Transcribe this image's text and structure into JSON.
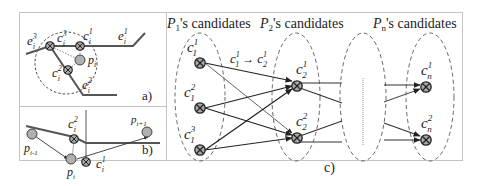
{
  "figure": {
    "panel_a": {
      "label": "a)",
      "edges": [
        {
          "name": "e",
          "sup": "3",
          "sub": "i"
        },
        {
          "name": "e",
          "sup": "1",
          "sub": "i"
        },
        {
          "name": "e",
          "sup": "2",
          "sub": "i"
        }
      ],
      "candidates": [
        {
          "name": "c",
          "sup": "3",
          "sub": "i"
        },
        {
          "name": "c",
          "sup": "1",
          "sub": "i"
        },
        {
          "name": "c",
          "sup": "2",
          "sub": "i"
        }
      ],
      "point": {
        "name": "p",
        "sub": "i"
      }
    },
    "panel_b": {
      "label": "b)",
      "points": [
        {
          "name": "p",
          "sub": "i-1"
        },
        {
          "name": "p",
          "sub": "i"
        },
        {
          "name": "p",
          "sub": "i+1"
        }
      ],
      "candidates": [
        {
          "name": "c",
          "sup": "2",
          "sub": "i"
        },
        {
          "name": "c",
          "sup": "1",
          "sub": "i"
        }
      ]
    },
    "panel_c": {
      "label": "c)",
      "headers": [
        {
          "name": "P",
          "sub": "1",
          "suffix": "'s candidates"
        },
        {
          "name": "P",
          "sub": "2",
          "suffix": "'s candidates"
        },
        {
          "name": "P",
          "sub": "n",
          "suffix": "'s candidates"
        }
      ],
      "transition_label": {
        "from": {
          "name": "c",
          "sup": "1",
          "sub": "1"
        },
        "arrow": "→",
        "to": {
          "name": "c",
          "sup": "1",
          "sub": "2"
        }
      },
      "groups": [
        {
          "id": "P1",
          "candidates": [
            {
              "name": "c",
              "sup": "1",
              "sub": "1"
            },
            {
              "name": "c",
              "sup": "2",
              "sub": "1"
            },
            {
              "name": "c",
              "sup": "3",
              "sub": "1"
            }
          ]
        },
        {
          "id": "P2",
          "candidates": [
            {
              "name": "c",
              "sup": "1",
              "sub": "2"
            },
            {
              "name": "c",
              "sup": "2",
              "sub": "2"
            }
          ]
        },
        {
          "id": "ellipsis",
          "candidates": []
        },
        {
          "id": "Pn",
          "candidates": [
            {
              "name": "c",
              "sup": "1",
              "sub": "n"
            },
            {
              "name": "c",
              "sup": "2",
              "sub": "n"
            }
          ]
        }
      ]
    },
    "colors": {
      "line": "#3a3a3a",
      "node_fill": "#b5b5b5",
      "candidate_fill": "#9a9a9a",
      "frame": "#bfbfbf"
    }
  }
}
